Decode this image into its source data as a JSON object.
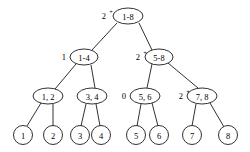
{
  "diagram": {
    "type": "binary-tree",
    "title": "",
    "canvas": {
      "width": 250,
      "height": 152
    },
    "levels": 4,
    "nodes": [
      {
        "id": "root",
        "label": "1-8",
        "shape": "ellipse",
        "level": 0,
        "cx": 128,
        "cy": 16,
        "rx": 15,
        "ry": 8,
        "side_label": "2",
        "side_superscript": "+",
        "side_label_x": 106,
        "side_label_y": 16,
        "side_superscript_x": 111,
        "side_superscript_y": 11
      },
      {
        "id": "n1-4",
        "label": "1-4",
        "shape": "ellipse",
        "level": 1,
        "cx": 84,
        "cy": 57,
        "rx": 14,
        "ry": 8,
        "side_label": "1",
        "side_superscript": "",
        "side_label_x": 66,
        "side_label_y": 57,
        "side_superscript_x": 0,
        "side_superscript_y": 0
      },
      {
        "id": "n5-8",
        "label": "5-8",
        "shape": "ellipse",
        "level": 1,
        "cx": 159,
        "cy": 57,
        "rx": 14,
        "ry": 8,
        "side_label": "2",
        "side_superscript": "+",
        "side_label_x": 140,
        "side_label_y": 57,
        "side_superscript_x": 145,
        "side_superscript_y": 52
      },
      {
        "id": "n1-2",
        "label": "1, 2",
        "shape": "ellipse",
        "level": 2,
        "cx": 48,
        "cy": 96,
        "rx": 15,
        "ry": 8,
        "side_label": "",
        "side_superscript": "",
        "side_label_x": 0,
        "side_label_y": 0,
        "side_superscript_x": 0,
        "side_superscript_y": 0
      },
      {
        "id": "n3-4",
        "label": "3, 4",
        "shape": "ellipse",
        "level": 2,
        "cx": 92,
        "cy": 96,
        "rx": 15,
        "ry": 8,
        "side_label": "",
        "side_superscript": "",
        "side_label_x": 0,
        "side_label_y": 0,
        "side_superscript_x": 0,
        "side_superscript_y": 0
      },
      {
        "id": "n5-6",
        "label": "5, 6",
        "shape": "ellipse",
        "level": 2,
        "cx": 145,
        "cy": 96,
        "rx": 15,
        "ry": 8,
        "side_label": "0",
        "side_superscript": "",
        "side_label_x": 126,
        "side_label_y": 96,
        "side_superscript_x": 0,
        "side_superscript_y": 0
      },
      {
        "id": "n7-8",
        "label": "7, 8",
        "shape": "ellipse",
        "level": 2,
        "cx": 202,
        "cy": 96,
        "rx": 15,
        "ry": 8,
        "side_label": "2",
        "side_superscript": "+",
        "side_label_x": 183,
        "side_label_y": 96,
        "side_superscript_x": 188,
        "side_superscript_y": 91
      },
      {
        "id": "leaf1",
        "label": "1",
        "shape": "circle",
        "level": 3,
        "cx": 23,
        "cy": 135,
        "rx": 9.5,
        "ry": 9.5,
        "side_label": "",
        "side_superscript": "",
        "side_label_x": 0,
        "side_label_y": 0,
        "side_superscript_x": 0,
        "side_superscript_y": 0
      },
      {
        "id": "leaf2",
        "label": "2",
        "shape": "circle",
        "level": 3,
        "cx": 53,
        "cy": 135,
        "rx": 9.5,
        "ry": 9.5,
        "side_label": "",
        "side_superscript": "",
        "side_label_x": 0,
        "side_label_y": 0,
        "side_superscript_x": 0,
        "side_superscript_y": 0
      },
      {
        "id": "leaf3",
        "label": "3",
        "shape": "circle",
        "level": 3,
        "cx": 80,
        "cy": 135,
        "rx": 9.5,
        "ry": 9.5,
        "side_label": "",
        "side_superscript": "",
        "side_label_x": 0,
        "side_label_y": 0,
        "side_superscript_x": 0,
        "side_superscript_y": 0
      },
      {
        "id": "leaf4",
        "label": "4",
        "shape": "circle",
        "level": 3,
        "cx": 101,
        "cy": 135,
        "rx": 9.5,
        "ry": 9.5,
        "side_label": "",
        "side_superscript": "",
        "side_label_x": 0,
        "side_label_y": 0,
        "side_superscript_x": 0,
        "side_superscript_y": 0
      },
      {
        "id": "leaf5",
        "label": "5",
        "shape": "circle",
        "level": 3,
        "cx": 136,
        "cy": 135,
        "rx": 9.5,
        "ry": 9.5,
        "side_label": "",
        "side_superscript": "",
        "side_label_x": 0,
        "side_label_y": 0,
        "side_superscript_x": 0,
        "side_superscript_y": 0
      },
      {
        "id": "leaf6",
        "label": "6",
        "shape": "circle",
        "level": 3,
        "cx": 159,
        "cy": 135,
        "rx": 9.5,
        "ry": 9.5,
        "side_label": "",
        "side_superscript": "",
        "side_label_x": 0,
        "side_label_y": 0,
        "side_superscript_x": 0,
        "side_superscript_y": 0
      },
      {
        "id": "leaf7",
        "label": "7",
        "shape": "circle",
        "level": 3,
        "cx": 192,
        "cy": 135,
        "rx": 9.5,
        "ry": 9.5,
        "side_label": "",
        "side_superscript": "",
        "side_label_x": 0,
        "side_label_y": 0,
        "side_superscript_x": 0,
        "side_superscript_y": 0
      },
      {
        "id": "leaf8",
        "label": "8",
        "shape": "circle",
        "level": 3,
        "cx": 228,
        "cy": 135,
        "rx": 9.5,
        "ry": 9.5,
        "side_label": "",
        "side_superscript": "",
        "side_label_x": 0,
        "side_label_y": 0,
        "side_superscript_x": 0,
        "side_superscript_y": 0
      }
    ],
    "edges": [
      {
        "from": "root",
        "to": "n1-4",
        "x1": 117,
        "y1": 23,
        "x2": 92,
        "y2": 50
      },
      {
        "from": "root",
        "to": "n5-8",
        "x1": 139,
        "y1": 23,
        "x2": 152,
        "y2": 50
      },
      {
        "from": "n1-4",
        "to": "n1-2",
        "x1": 76,
        "y1": 64,
        "x2": 55,
        "y2": 89
      },
      {
        "from": "n1-4",
        "to": "n3-4",
        "x1": 91,
        "y1": 65,
        "x2": 95,
        "y2": 88
      },
      {
        "from": "n5-8",
        "to": "n5-6",
        "x1": 152,
        "y1": 64,
        "x2": 147,
        "y2": 88
      },
      {
        "from": "n5-8",
        "to": "n7-8",
        "x1": 168,
        "y1": 63,
        "x2": 198,
        "y2": 88
      },
      {
        "from": "n1-2",
        "to": "leaf1",
        "x1": 41,
        "y1": 103,
        "x2": 27,
        "y2": 126
      },
      {
        "from": "n1-2",
        "to": "leaf2",
        "x1": 53,
        "y1": 104,
        "x2": 53,
        "y2": 126
      },
      {
        "from": "n3-4",
        "to": "leaf3",
        "x1": 86,
        "y1": 104,
        "x2": 81,
        "y2": 126
      },
      {
        "from": "n3-4",
        "to": "leaf4",
        "x1": 96,
        "y1": 104,
        "x2": 100,
        "y2": 126
      },
      {
        "from": "n5-6",
        "to": "leaf5",
        "x1": 141,
        "y1": 104,
        "x2": 137,
        "y2": 126
      },
      {
        "from": "n5-6",
        "to": "leaf6",
        "x1": 152,
        "y1": 103,
        "x2": 158,
        "y2": 126
      },
      {
        "from": "n7-8",
        "to": "leaf7",
        "x1": 196,
        "y1": 104,
        "x2": 192,
        "y2": 126
      },
      {
        "from": "n7-8",
        "to": "leaf8",
        "x1": 210,
        "y1": 103,
        "x2": 224,
        "y2": 127
      }
    ],
    "colors": {
      "stroke": "#1a1a1a",
      "fill": "#ffffff",
      "text": "#000000",
      "background": "#ffffff"
    }
  }
}
